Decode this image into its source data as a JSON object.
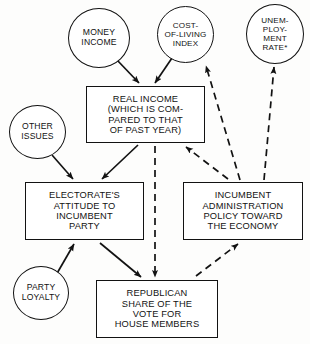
{
  "diagram": {
    "nodes": [
      {
        "id": "money_income",
        "label": "MONEY\nINCOME",
        "shape": "circle",
        "x": 68,
        "y": 8,
        "w": 62,
        "h": 60
      },
      {
        "id": "cost_of_living_index",
        "label": "COST-\nOF-LIVING\nINDEX",
        "shape": "circle",
        "x": 157,
        "y": 6,
        "w": 57,
        "h": 57
      },
      {
        "id": "unemployment_rate",
        "label": "UNEM-\nPLOY-\nMENT\nRATE*",
        "shape": "circle",
        "x": 246,
        "y": 4,
        "w": 58,
        "h": 60
      },
      {
        "id": "real_income",
        "label": "REAL INCOME\n(WHICH IS COM-\nPARED TO THAT\nOF PAST YEAR)",
        "shape": "box",
        "x": 86,
        "y": 86,
        "w": 119,
        "h": 57
      },
      {
        "id": "other_issues",
        "label": "OTHER\nISSUES",
        "shape": "circle",
        "x": 9,
        "y": 105,
        "w": 57,
        "h": 54
      },
      {
        "id": "electorate_attitude",
        "label": "ELECTORATE'S\nATTITUDE TO\nINCUMBENT\nPARTY",
        "shape": "box",
        "x": 25,
        "y": 182,
        "w": 119,
        "h": 58
      },
      {
        "id": "incumbent_policy",
        "label": "INCUMBENT\nADMINISTRATION\nPOLICY TOWARD\nTHE ECONOMY",
        "shape": "box",
        "x": 183,
        "y": 182,
        "w": 120,
        "h": 58
      },
      {
        "id": "party_loyalty",
        "label": "PARTY\nLOYALTY",
        "shape": "circle",
        "x": 13,
        "y": 266,
        "w": 56,
        "h": 54
      },
      {
        "id": "republican_share",
        "label": "REPUBLICAN\nSHARE OF THE\nVOTE FOR\nHOUSE MEMBERS",
        "shape": "box",
        "x": 96,
        "y": 280,
        "w": 122,
        "h": 58
      }
    ],
    "edges": [
      {
        "id": "money-to-real",
        "from": "money_income",
        "to": "real_income",
        "style": "solid"
      },
      {
        "id": "cost-to-real",
        "from": "cost_of_living_index",
        "to": "real_income",
        "style": "solid"
      },
      {
        "id": "real-to-electorate",
        "from": "real_income",
        "to": "electorate_attitude",
        "style": "solid"
      },
      {
        "id": "other-to-electorate",
        "from": "other_issues",
        "to": "electorate_attitude",
        "style": "solid"
      },
      {
        "id": "loyalty-to-electorate",
        "from": "party_loyalty",
        "to": "electorate_attitude",
        "style": "solid"
      },
      {
        "id": "electorate-to-republican",
        "from": "electorate_attitude",
        "to": "republican_share",
        "style": "solid"
      },
      {
        "id": "real-to-republican",
        "from": "real_income",
        "to": "republican_share",
        "style": "dashed"
      },
      {
        "id": "republican-to-policy",
        "from": "republican_share",
        "to": "incumbent_policy",
        "style": "dashed"
      },
      {
        "id": "policy-to-real",
        "from": "incumbent_policy",
        "to": "real_income",
        "style": "dashed"
      },
      {
        "id": "policy-to-cost",
        "from": "incumbent_policy",
        "to": "cost_of_living_index",
        "style": "dashed"
      },
      {
        "id": "policy-to-unemployment",
        "from": "incumbent_policy",
        "to": "unemployment_rate",
        "style": "dashed"
      }
    ],
    "colors": {
      "stroke": "#121212",
      "background": "#fdfdfc",
      "node_fill": "#ffffff"
    }
  }
}
